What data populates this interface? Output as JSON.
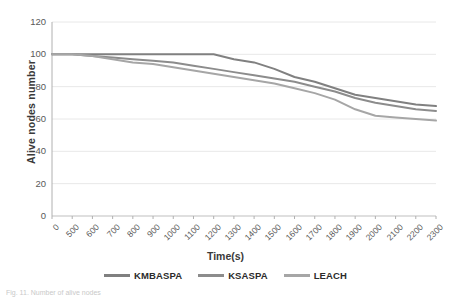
{
  "chart_data": {
    "type": "line",
    "title": "",
    "xlabel": "Time(s)",
    "ylabel": "Alive nodes number",
    "x": [
      0,
      500,
      600,
      700,
      800,
      900,
      1000,
      1100,
      1200,
      1300,
      1400,
      1500,
      1600,
      1700,
      1800,
      1900,
      2000,
      2100,
      2200,
      2300
    ],
    "xticklabels": [
      "0",
      "500",
      "600",
      "700",
      "800",
      "900",
      "1000",
      "1100",
      "1200",
      "1300",
      "1400",
      "1500",
      "1600",
      "1700",
      "1800",
      "1900",
      "2000",
      "2100",
      "2200",
      "2300"
    ],
    "yticks": [
      0,
      20,
      40,
      60,
      80,
      100,
      120
    ],
    "yticklabels": [
      "0",
      "20",
      "40",
      "60",
      "80",
      "100",
      "120"
    ],
    "ylim": [
      0,
      120
    ],
    "grid": "horizontal",
    "legend_position": "bottom",
    "series": [
      {
        "name": "KMBASPA",
        "color": "#808080",
        "values": [
          100,
          100,
          100,
          100,
          100,
          100,
          100,
          100,
          100,
          97,
          95,
          91,
          86,
          83,
          79,
          75,
          73,
          71,
          69,
          68
        ]
      },
      {
        "name": "KSASPA",
        "color": "#8c8c8c",
        "values": [
          100,
          100,
          99,
          98,
          97,
          96,
          95,
          93,
          91,
          89,
          87,
          85,
          83,
          80,
          77,
          73,
          70,
          68,
          66,
          65
        ]
      },
      {
        "name": "LEACH",
        "color": "#a6a6a6",
        "values": [
          100,
          100,
          99,
          97,
          95,
          94,
          92,
          90,
          88,
          86,
          84,
          82,
          79,
          76,
          72,
          66,
          62,
          61,
          60,
          59
        ]
      }
    ]
  },
  "legend": {
    "items": [
      {
        "label": "KMBASPA"
      },
      {
        "label": "KSASPA"
      },
      {
        "label": "LEACH"
      }
    ]
  },
  "caption": {
    "text": "Fig. 11. Number of alive nodes"
  }
}
